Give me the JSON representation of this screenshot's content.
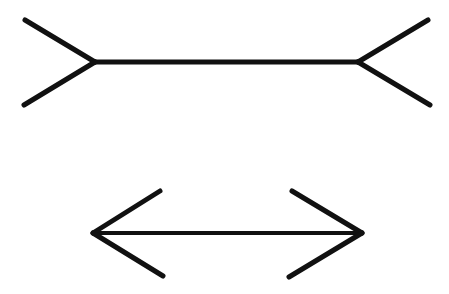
{
  "diagram": {
    "name": "Müller-Lyer illusion",
    "background": "#ffffff",
    "line_color": "#111111",
    "figures": [
      {
        "id": "fins-out",
        "shaft": {
          "x1": 95,
          "y1": 62,
          "x2": 358,
          "y2": 62,
          "width": 5
        },
        "fins": [
          {
            "x1": 95,
            "y1": 62,
            "x2": 25,
            "y2": 20
          },
          {
            "x1": 95,
            "y1": 62,
            "x2": 24,
            "y2": 105
          },
          {
            "x1": 358,
            "y1": 62,
            "x2": 428,
            "y2": 20
          },
          {
            "x1": 358,
            "y1": 62,
            "x2": 430,
            "y2": 105
          }
        ],
        "fin_width": 5
      },
      {
        "id": "arrows-in",
        "shaft": {
          "x1": 93,
          "y1": 233,
          "x2": 362,
          "y2": 233,
          "width": 4
        },
        "fins": [
          {
            "x1": 93,
            "y1": 233,
            "x2": 160,
            "y2": 191
          },
          {
            "x1": 93,
            "y1": 233,
            "x2": 163,
            "y2": 276
          },
          {
            "x1": 362,
            "y1": 233,
            "x2": 292,
            "y2": 191
          },
          {
            "x1": 362,
            "y1": 233,
            "x2": 289,
            "y2": 277
          }
        ],
        "fin_width": 5
      }
    ]
  }
}
